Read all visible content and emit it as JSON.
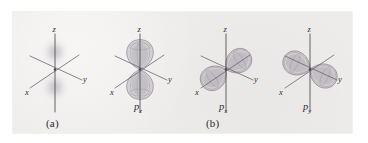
{
  "figure": {
    "kind": "orbital-diagram",
    "background_color": "#ffffff",
    "panel_color": "#eeecea",
    "axis_color": "#55515a",
    "lobe_fill_color": "#a9a3ae",
    "lobe_stroke_color": "#7d7784",
    "cloud_color": "#9b96a1"
  },
  "captions": {
    "a": "(a)",
    "b": "(b)"
  },
  "axes": {
    "z": "z",
    "x": "x",
    "y": "y"
  },
  "panels": [
    {
      "id": "a",
      "caption": "(a)",
      "orbital_label": "",
      "description": "diffuse probability density cloud concentrated above and below the origin along the z axis",
      "axis_labels": [
        "z",
        "x",
        "y"
      ]
    },
    {
      "id": "pz",
      "caption": "",
      "orbital_label": "p",
      "orbital_subscript": "z",
      "description": "two-lobed dumbbell oriented along the z axis",
      "axis_labels": [
        "z",
        "x",
        "y"
      ]
    },
    {
      "id": "px",
      "caption": "(b)",
      "orbital_label": "p",
      "orbital_subscript": "x",
      "description": "two-lobed dumbbell oriented along the x axis",
      "axis_labels": [
        "z",
        "x",
        "y"
      ]
    },
    {
      "id": "py",
      "caption": "",
      "orbital_label": "p",
      "orbital_subscript": "y",
      "description": "two-lobed dumbbell oriented along the y axis",
      "axis_labels": [
        "z",
        "x",
        "y"
      ]
    }
  ]
}
